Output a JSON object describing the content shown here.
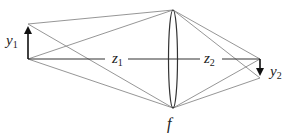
{
  "diagram": {
    "type": "thin-lens-imaging",
    "labels": {
      "object_height": {
        "base": "y",
        "sub": "1"
      },
      "image_height": {
        "base": "y",
        "sub": "2"
      },
      "object_distance": {
        "base": "z",
        "sub": "1"
      },
      "image_distance": {
        "base": "z",
        "sub": "2"
      },
      "focal_length": {
        "base": "f",
        "sub": ""
      }
    },
    "colors": {
      "ray": "#8a8a8a",
      "axis": "#333333",
      "arrow": "#111111",
      "lens": "#333333"
    },
    "geometry": {
      "axis_y": 59,
      "object_x": 28,
      "object_tip_y": 24,
      "lens_x": 173,
      "lens_top_y": 10,
      "lens_bottom_y": 108,
      "image_x": 260,
      "image_tip_y": 78
    }
  }
}
